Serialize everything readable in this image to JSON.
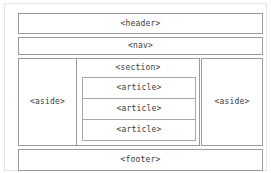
{
  "diagram": {
    "type": "html5-semantic-layout",
    "background_color": "#ffffff",
    "border_color": "#9a9a9a",
    "text_color": "#3a3a3a",
    "frame_border_color": "#e3e3e3",
    "header": {
      "label": "<header>"
    },
    "nav": {
      "label": "<nav>"
    },
    "aside_left": {
      "label": "<aside>"
    },
    "section": {
      "label": "<section>",
      "articles": [
        {
          "label": "<article>"
        },
        {
          "label": "<article>"
        },
        {
          "label": "<article>"
        }
      ]
    },
    "aside_right": {
      "label": "<aside>"
    },
    "footer": {
      "label": "<footer>"
    }
  }
}
